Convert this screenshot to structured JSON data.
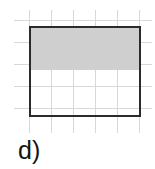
{
  "figure": {
    "label": "d)",
    "kind": "area-model-fraction-diagram",
    "colors": {
      "grid_line": "#d8d8d8",
      "outline": "#2b2b2b",
      "shading": "#cfcfcf",
      "background": "#ffffff",
      "label_text": "#141414"
    },
    "rectangle": {
      "x": 29,
      "y": 26,
      "width": 112,
      "height": 91,
      "columns": 5,
      "rows": 4
    },
    "shaded": {
      "x": 31,
      "y": 28,
      "width": 108,
      "height": 42,
      "rows_shaded": 2,
      "fraction": "2/4"
    },
    "grid": {
      "spacing": 22,
      "vertical_x": [
        29,
        51,
        73,
        95,
        117,
        139
      ],
      "vertical_top": 10,
      "vertical_bottom": 133,
      "horizontal_y": [
        20,
        42,
        64,
        86,
        108
      ],
      "horizontal_left": 14,
      "horizontal_right": 152
    }
  }
}
